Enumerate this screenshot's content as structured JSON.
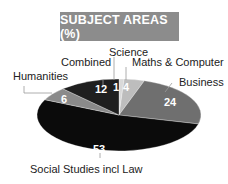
{
  "chart_data": {
    "type": "pie",
    "title": "SUBJECT AREAS (%)",
    "categories": [
      "Science",
      "Maths & Computer",
      "Business",
      "Social Studies incl Law",
      "Humanities",
      "Combined"
    ],
    "values": [
      1,
      4,
      24,
      53,
      6,
      12
    ],
    "unit": "%",
    "colors": [
      "#d9d9d9",
      "#bdbdbd",
      "#6f6f6f",
      "#0b0b0b",
      "#8a8a8a",
      "#1f1f1f"
    ],
    "start_angle_deg": 0,
    "direction": "clockwise",
    "shape": "elliptical (3D tilted)",
    "legend": "none (external labels with leader lines)"
  },
  "labels": {
    "science": "Science",
    "maths": "Maths & Computer",
    "business": "Business",
    "social": "Social Studies incl Law",
    "humanities": "Humanities",
    "combined": "Combined"
  },
  "values_text": {
    "science": "1",
    "maths": "4",
    "business": "24",
    "social": "53",
    "humanities": "6",
    "combined": "12"
  }
}
